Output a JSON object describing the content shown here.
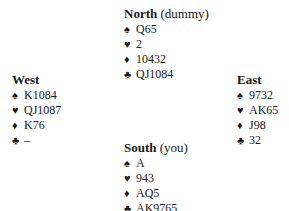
{
  "hands": {
    "north": {
      "name": "North",
      "role": "(dummy)",
      "suits": [
        {
          "symbol": "♠",
          "icon": "spade-icon",
          "cards": "Q65"
        },
        {
          "symbol": "♥",
          "icon": "heart-icon",
          "cards": "2"
        },
        {
          "symbol": "♦",
          "icon": "diamond-icon",
          "cards": "10432"
        },
        {
          "symbol": "♣",
          "icon": "club-icon",
          "cards": "QJ1084"
        }
      ]
    },
    "west": {
      "name": "West",
      "role": "",
      "suits": [
        {
          "symbol": "♠",
          "icon": "spade-icon",
          "cards": "K1084"
        },
        {
          "symbol": "♥",
          "icon": "heart-icon",
          "cards": "QJ1087"
        },
        {
          "symbol": "♦",
          "icon": "diamond-icon",
          "cards": "K76"
        },
        {
          "symbol": "♣",
          "icon": "club-icon",
          "cards": "–"
        }
      ]
    },
    "east": {
      "name": "East",
      "role": "",
      "suits": [
        {
          "symbol": "♠",
          "icon": "spade-icon",
          "cards": "9732"
        },
        {
          "symbol": "♥",
          "icon": "heart-icon",
          "cards": "AK65"
        },
        {
          "symbol": "♦",
          "icon": "diamond-icon",
          "cards": "J98"
        },
        {
          "symbol": "♣",
          "icon": "club-icon",
          "cards": "32"
        }
      ]
    },
    "south": {
      "name": "South",
      "role": "(you)",
      "suits": [
        {
          "symbol": "♠",
          "icon": "spade-icon",
          "cards": "A"
        },
        {
          "symbol": "♥",
          "icon": "heart-icon",
          "cards": "943"
        },
        {
          "symbol": "♦",
          "icon": "diamond-icon",
          "cards": "AQ5"
        },
        {
          "symbol": "♣",
          "icon": "club-icon",
          "cards": "AK9765"
        }
      ]
    }
  }
}
